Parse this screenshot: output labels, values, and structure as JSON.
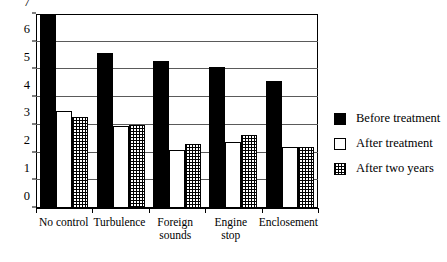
{
  "chart_data": {
    "type": "bar",
    "title": "",
    "subtitle": "",
    "xlabel": "",
    "ylabel": "",
    "ylim": [
      0,
      7
    ],
    "y_ticks": [
      0,
      1,
      2,
      3,
      4,
      5,
      6,
      7
    ],
    "grid": true,
    "legend_position": "right",
    "categories": [
      "No control",
      "Foreign sounds",
      "Turbulence",
      "Engine stop",
      "Enclosement"
    ],
    "category_lines": [
      [
        "No control"
      ],
      [
        "Turbulence"
      ],
      [
        "Foreign",
        "sounds"
      ],
      [
        "Engine",
        "stop"
      ],
      [
        "Enclosement"
      ]
    ],
    "series": [
      {
        "name": "Before treatment",
        "fill": "solid-black",
        "color": "#000000",
        "values": [
          7.0,
          5.6,
          5.3,
          5.1,
          4.6
        ]
      },
      {
        "name": "After treatment",
        "fill": "white-outline",
        "color": "#ffffff",
        "values": [
          3.5,
          2.95,
          2.1,
          2.4,
          2.2
        ]
      },
      {
        "name": "After two years",
        "fill": "dotted-grid",
        "color": "#ffffff",
        "values": [
          3.3,
          3.0,
          2.3,
          2.65,
          2.2
        ]
      }
    ]
  },
  "legend": {
    "items": [
      {
        "label": "Before treatment",
        "swatch": "solid-black-swatch"
      },
      {
        "label": "After treatment",
        "swatch": "white-outline-swatch"
      },
      {
        "label": "After two years",
        "swatch": "dotted-grid-swatch"
      }
    ]
  },
  "axis": {
    "y_tick_labels": [
      "0",
      "1",
      "2",
      "3",
      "4",
      "5",
      "6",
      "7"
    ]
  }
}
